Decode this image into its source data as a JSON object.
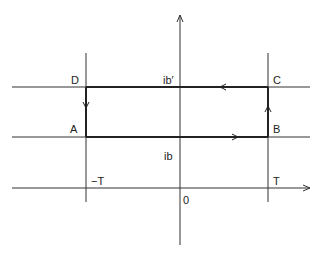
{
  "diagram": {
    "labels": {
      "D": "D",
      "C": "C",
      "A": "A",
      "B": "B",
      "ib_prime": "ib′",
      "ib": "ib",
      "minus_T": "−T",
      "T": "T",
      "origin": "0"
    },
    "colors": {
      "line": "#333333",
      "background": "#ffffff"
    }
  }
}
